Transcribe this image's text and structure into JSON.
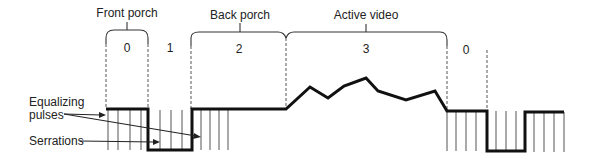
{
  "diagram": {
    "type": "video-sync-waveform",
    "intervals": [
      {
        "index_label": "0",
        "label": "Front porch"
      },
      {
        "index_label": "1",
        "label": ""
      },
      {
        "index_label": "2",
        "label": "Back porch"
      },
      {
        "index_label": "3",
        "label": "Active video"
      },
      {
        "index_label": "0",
        "label": ""
      }
    ],
    "annotations": {
      "equalizing_line1": "Equalizing",
      "equalizing_line2": "pulses",
      "serrations": "Serrations"
    },
    "colors": {
      "signal": "#111111",
      "guides": "#555555",
      "text": "#222222",
      "background": "#ffffff"
    }
  }
}
